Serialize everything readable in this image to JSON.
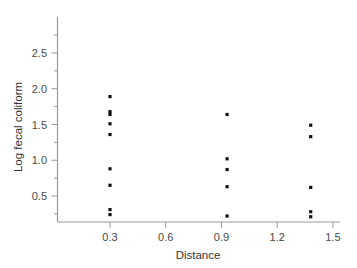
{
  "chart_data": {
    "type": "scatter",
    "title": "",
    "xlabel": "Distance",
    "ylabel": "Log fecal coliform",
    "xlim": [
      0.12,
      1.56
    ],
    "ylim": [
      0.0,
      2.88
    ],
    "xticks": [
      0.3,
      0.6,
      0.9,
      1.2,
      1.5
    ],
    "xticklabels": [
      "0.3",
      "0.6",
      "0.9",
      "1.2",
      "1.5"
    ],
    "yticks": [
      0.5,
      1.0,
      1.5,
      2.0,
      2.5
    ],
    "yticklabels": [
      "0.5",
      "1.0",
      "1.5",
      "2.0",
      "2.5"
    ],
    "yminorticks": [
      0.25,
      0.75,
      1.25,
      1.75,
      2.25,
      2.75
    ],
    "grid": false,
    "legend": null,
    "marker": "square",
    "marker_size": 3.2,
    "marker_color": "#111111",
    "points": [
      {
        "x": 0.3,
        "y": 1.89
      },
      {
        "x": 0.3,
        "y": 1.68
      },
      {
        "x": 0.3,
        "y": 1.64
      },
      {
        "x": 0.3,
        "y": 1.51
      },
      {
        "x": 0.3,
        "y": 1.36
      },
      {
        "x": 0.3,
        "y": 0.88
      },
      {
        "x": 0.3,
        "y": 0.65
      },
      {
        "x": 0.3,
        "y": 0.31
      },
      {
        "x": 0.3,
        "y": 0.24
      },
      {
        "x": 0.93,
        "y": 1.64
      },
      {
        "x": 0.93,
        "y": 1.02
      },
      {
        "x": 0.93,
        "y": 0.87
      },
      {
        "x": 0.93,
        "y": 0.63
      },
      {
        "x": 0.93,
        "y": 0.22
      },
      {
        "x": 1.38,
        "y": 1.49
      },
      {
        "x": 1.38,
        "y": 1.33
      },
      {
        "x": 1.38,
        "y": 0.62
      },
      {
        "x": 1.38,
        "y": 0.28
      },
      {
        "x": 1.38,
        "y": 0.21
      }
    ]
  },
  "figure": {
    "background_color": "#ffffff",
    "axis_color": "#9a9a9a",
    "text_color": "#333333"
  }
}
